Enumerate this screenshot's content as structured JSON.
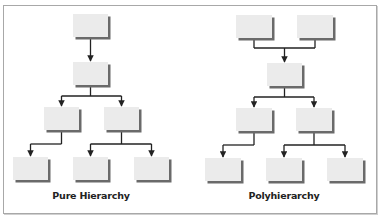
{
  "figure": {
    "colors": {
      "box_fill": "#ebebeb",
      "box_shadow": "#6a6a6a",
      "line": "#222222",
      "frame": "#a8a8a8"
    },
    "diagrams": [
      {
        "id": "pure",
        "label": "Pure Hierarchy",
        "label_pos": {
          "x": 91,
          "y": 190
        },
        "nodes": [
          {
            "id": "p0",
            "x": 73,
            "y": 14,
            "w": 35,
            "h": 23
          },
          {
            "id": "p1",
            "x": 73,
            "y": 62,
            "w": 35,
            "h": 23
          },
          {
            "id": "p2",
            "x": 44,
            "y": 107,
            "w": 35,
            "h": 23
          },
          {
            "id": "p3",
            "x": 104,
            "y": 107,
            "w": 35,
            "h": 23
          },
          {
            "id": "p4",
            "x": 13,
            "y": 157,
            "w": 35,
            "h": 23
          },
          {
            "id": "p5",
            "x": 73,
            "y": 157,
            "w": 35,
            "h": 23
          },
          {
            "id": "p6",
            "x": 134,
            "y": 157,
            "w": 35,
            "h": 23
          }
        ],
        "edges": [
          {
            "from": "p0",
            "to": [
              "p1"
            ]
          },
          {
            "from": "p1",
            "to": [
              "p2",
              "p3"
            ]
          },
          {
            "from": "p2",
            "to": [
              "p4"
            ]
          },
          {
            "from": "p3",
            "to": [
              "p5",
              "p6"
            ]
          }
        ]
      },
      {
        "id": "poly",
        "label": "Polyhierarchy",
        "label_pos": {
          "x": 284,
          "y": 190
        },
        "nodes": [
          {
            "id": "q0",
            "x": 236,
            "y": 15,
            "w": 36,
            "h": 23
          },
          {
            "id": "q1",
            "x": 297,
            "y": 15,
            "w": 36,
            "h": 23
          },
          {
            "id": "q2",
            "x": 267,
            "y": 63,
            "w": 35,
            "h": 23
          },
          {
            "id": "q3",
            "x": 236,
            "y": 108,
            "w": 36,
            "h": 23
          },
          {
            "id": "q4",
            "x": 296,
            "y": 108,
            "w": 36,
            "h": 23
          },
          {
            "id": "q5",
            "x": 205,
            "y": 158,
            "w": 36,
            "h": 23
          },
          {
            "id": "q6",
            "x": 266,
            "y": 158,
            "w": 36,
            "h": 23
          },
          {
            "id": "q7",
            "x": 327,
            "y": 158,
            "w": 36,
            "h": 23
          }
        ],
        "edges": [
          {
            "from": [
              "q0",
              "q1"
            ],
            "to": [
              "q2"
            ]
          },
          {
            "from": "q2",
            "to": [
              "q3",
              "q4"
            ]
          },
          {
            "from": "q3",
            "to": [
              "q5"
            ]
          },
          {
            "from": "q4",
            "to": [
              "q6",
              "q7"
            ]
          }
        ]
      }
    ]
  }
}
